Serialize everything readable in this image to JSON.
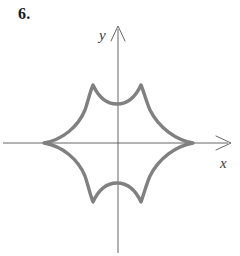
{
  "figure": {
    "problem_number": "6.",
    "caption": "",
    "background_color": "#ffffff"
  },
  "axes": {
    "x_label": "x",
    "y_label": "y",
    "axis_color": "#555555",
    "axis_line_width": 0.9,
    "origin": {
      "x": 118,
      "y": 143
    },
    "x_axis": {
      "start_x": 3,
      "end_x": 233,
      "y": 143,
      "has_arrow": true,
      "arrow_end": "right"
    },
    "y_axis": {
      "x": 118,
      "start_y": 253,
      "end_y": 24,
      "has_arrow": true,
      "arrow_end": "top"
    },
    "tick_labels": [],
    "grid": false
  },
  "chart_data": {
    "type": "line",
    "title": "",
    "subtitle": "",
    "xlabel": "x",
    "ylabel": "y",
    "legend": [],
    "annotations": [],
    "grid": false,
    "xlim": [
      -2.6,
      4.0
    ],
    "ylim": [
      -3.8,
      2.0
    ],
    "curve": {
      "name": "six-cusped closed curve",
      "stroke_color": "#808080",
      "stroke_width": 3.4,
      "closed": true,
      "cusps": [
        {
          "label": "left-cusp",
          "x": 44,
          "y": 143
        },
        {
          "label": "top-left-cusp",
          "x": 93,
          "y": 85
        },
        {
          "label": "top-right-cusp",
          "x": 141,
          "y": 85
        },
        {
          "label": "right-cusp",
          "x": 193,
          "y": 143
        },
        {
          "label": "bottom-right-cusp",
          "x": 141,
          "y": 202
        },
        {
          "label": "bottom-left-cusp",
          "x": 93,
          "y": 202
        }
      ],
      "arc_midpoints": [
        {
          "label": "top-concave-dip",
          "x": 117,
          "y": 104
        },
        {
          "label": "bottom-concave-bulge",
          "x": 117,
          "y": 183
        }
      ],
      "path": "M 44 143 C 62 140 78 127 85 110 C 88 101 90 92 93 85 C 98 96 106 104 117 104 C 128 104 136 96 141 85 C 144 92 146 101 150 110 C 159 128 176 140 193 143 C 176 146 159 158 150 176 C 146 185 144 194 141 202 C 136 191 128 183 117 183 C 106 183 98 191 93 202 C 90 194 88 185 85 176 C 78 159 62 146 44 143 Z"
    }
  }
}
